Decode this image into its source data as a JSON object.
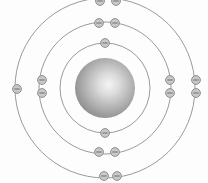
{
  "diagram": {
    "background_color": "#fdfdfd",
    "canvas": {
      "width": 208,
      "height": 183
    },
    "nucleus": {
      "label": "nucleus",
      "center_x": 105,
      "center_y": 88,
      "radius": 30,
      "color_center": "#f2f2f2",
      "color_mid": "#b4b4b4",
      "color_edge": "#8d8d8d",
      "highlight_x": 113,
      "highlight_y": 82
    },
    "shell_color": "#9a9a9a",
    "electron_color_fill": "#c8c8c8",
    "electron_color_stroke": "#8e8e8e",
    "electron_sign_color": "#6e6e6e",
    "electron_radius": 4.4,
    "electron_sign_label": "minus",
    "shells": [
      {
        "name": "shell-1",
        "index": 1,
        "radius": 45,
        "electron_count": 2,
        "electrons": [
          {
            "x": 105,
            "y": 43
          },
          {
            "x": 105,
            "y": 133
          }
        ]
      },
      {
        "name": "shell-2",
        "index": 2,
        "radius": 66,
        "electron_count": 8,
        "electrons": [
          {
            "x": 99,
            "y": 23
          },
          {
            "x": 115,
            "y": 23
          },
          {
            "x": 99,
            "y": 152
          },
          {
            "x": 115,
            "y": 152
          },
          {
            "x": 42,
            "y": 80
          },
          {
            "x": 42,
            "y": 93
          },
          {
            "x": 170,
            "y": 80
          },
          {
            "x": 170,
            "y": 93
          }
        ]
      },
      {
        "name": "shell-3",
        "index": 3,
        "radius": 90,
        "electron_count": 7,
        "electrons": [
          {
            "x": 100,
            "y": 1
          },
          {
            "x": 116,
            "y": 1
          },
          {
            "x": 104,
            "y": 176
          },
          {
            "x": 117,
            "y": 176
          },
          {
            "x": 17,
            "y": 89
          },
          {
            "x": 196,
            "y": 80
          },
          {
            "x": 196,
            "y": 93
          }
        ]
      }
    ]
  }
}
